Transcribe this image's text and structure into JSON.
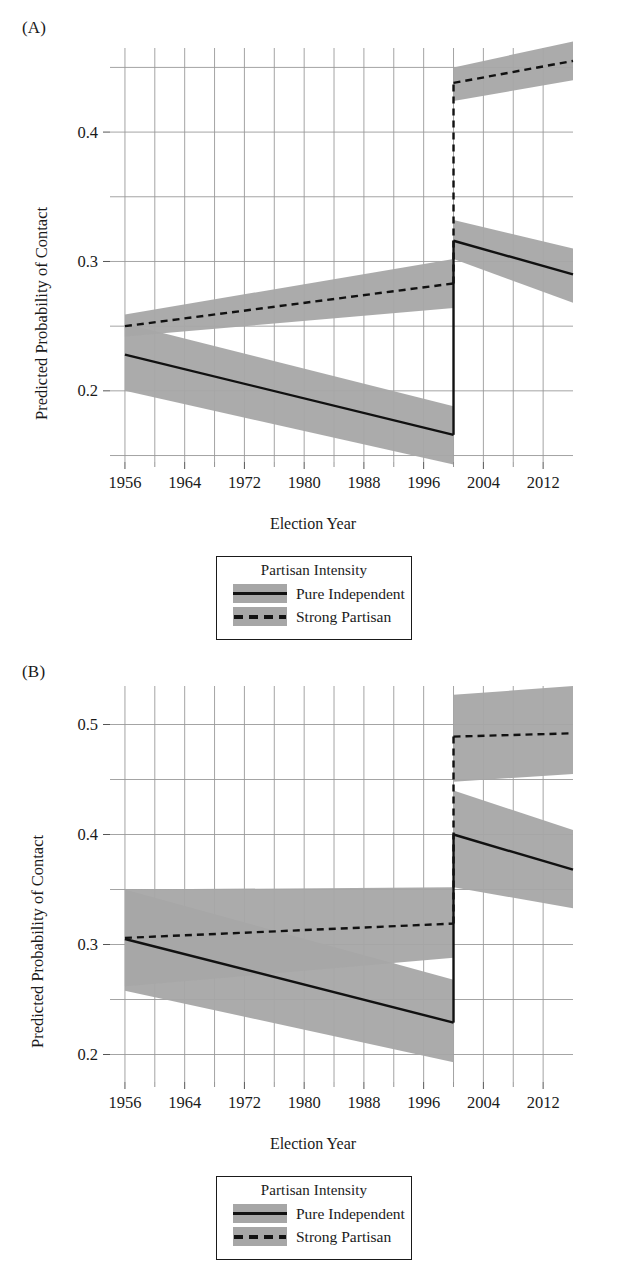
{
  "figure": {
    "panels": [
      {
        "tag": "(A)",
        "xlabel": "Election Year",
        "ylabel": "Predicted Probability of Contact",
        "xticks": [
          "1956",
          "1964",
          "1972",
          "1980",
          "1988",
          "1996",
          "2004",
          "2012"
        ],
        "yticks": [
          "0.2",
          "0.3",
          "0.4"
        ]
      },
      {
        "tag": "(B)",
        "xlabel": "Election Year",
        "ylabel": "Predicted Probability of Contact",
        "xticks": [
          "1956",
          "1964",
          "1972",
          "1980",
          "1988",
          "1996",
          "2004",
          "2012"
        ],
        "yticks": [
          "0.2",
          "0.3",
          "0.4",
          "0.5"
        ]
      }
    ],
    "legend": {
      "title": "Partisan Intensity",
      "entries": [
        {
          "label": "Pure Independent",
          "style": "solid",
          "line_color": "#111111",
          "band_color": "#a6a6a6"
        },
        {
          "label": "Strong Partisan",
          "style": "dashed",
          "line_color": "#111111",
          "band_color": "#a6a6a6"
        }
      ]
    }
  },
  "chart_data": [
    {
      "type": "line",
      "panel": "(A)",
      "title": "",
      "xlabel": "Election Year",
      "ylabel": "Predicted Probability of Contact",
      "xlim": [
        1954,
        2016
      ],
      "ylim": [
        0.145,
        0.465
      ],
      "xticks": [
        1956,
        1964,
        1972,
        1980,
        1988,
        1996,
        2004,
        2012
      ],
      "yticks": [
        0.2,
        0.3,
        0.4
      ],
      "y_minor_gridlines": [
        0.15,
        0.25,
        0.35,
        0.45
      ],
      "x_minor_gridlines": [
        1960,
        1968,
        1976,
        1984,
        1992,
        2000,
        2008
      ],
      "grid": true,
      "legend_position": "below",
      "discontinuity_x": 2000,
      "series": [
        {
          "name": "Pure Independent",
          "style": "solid",
          "color": "#111111",
          "band_color": "#a6a6a6",
          "segments": [
            {
              "x": [
                1956,
                2000
              ],
              "y": [
                0.228,
                0.166
              ],
              "band_lower": [
                0.2,
                0.143
              ],
              "band_upper": [
                0.252,
                0.188
              ]
            },
            {
              "x": [
                2000,
                2016
              ],
              "y": [
                0.316,
                0.29
              ],
              "band_lower": [
                0.302,
                0.268
              ],
              "band_upper": [
                0.332,
                0.31
              ]
            }
          ]
        },
        {
          "name": "Strong Partisan",
          "style": "dashed",
          "color": "#111111",
          "band_color": "#a6a6a6",
          "segments": [
            {
              "x": [
                1956,
                2000
              ],
              "y": [
                0.25,
                0.283
              ],
              "band_lower": [
                0.242,
                0.264
              ],
              "band_upper": [
                0.259,
                0.302
              ]
            },
            {
              "x": [
                2000,
                2016
              ],
              "y": [
                0.438,
                0.455
              ],
              "band_lower": [
                0.424,
                0.44
              ],
              "band_upper": [
                0.45,
                0.47
              ]
            }
          ]
        }
      ]
    },
    {
      "type": "line",
      "panel": "(B)",
      "title": "",
      "xlabel": "Election Year",
      "ylabel": "Predicted Probability of Contact",
      "xlim": [
        1954,
        2016
      ],
      "ylim": [
        0.175,
        0.535
      ],
      "xticks": [
        1956,
        1964,
        1972,
        1980,
        1988,
        1996,
        2004,
        2012
      ],
      "yticks": [
        0.2,
        0.3,
        0.4,
        0.5
      ],
      "y_minor_gridlines": [
        0.25,
        0.35,
        0.45
      ],
      "x_minor_gridlines": [
        1960,
        1968,
        1976,
        1984,
        1992,
        2000,
        2008
      ],
      "grid": true,
      "legend_position": "below",
      "discontinuity_x": 2000,
      "series": [
        {
          "name": "Pure Independent",
          "style": "solid",
          "color": "#111111",
          "band_color": "#a6a6a6",
          "segments": [
            {
              "x": [
                1956,
                2000
              ],
              "y": [
                0.305,
                0.229
              ],
              "band_lower": [
                0.258,
                0.193
              ],
              "band_upper": [
                0.35,
                0.268
              ]
            },
            {
              "x": [
                2000,
                2016
              ],
              "y": [
                0.4,
                0.368
              ],
              "band_lower": [
                0.352,
                0.333
              ],
              "band_upper": [
                0.44,
                0.404
              ]
            }
          ]
        },
        {
          "name": "Strong Partisan",
          "style": "dashed",
          "color": "#111111",
          "band_color": "#a6a6a6",
          "segments": [
            {
              "x": [
                1956,
                2000
              ],
              "y": [
                0.306,
                0.319
              ],
              "band_lower": [
                0.262,
                0.288
              ],
              "band_upper": [
                0.35,
                0.352
              ]
            },
            {
              "x": [
                2000,
                2016
              ],
              "y": [
                0.489,
                0.492
              ],
              "band_lower": [
                0.448,
                0.455
              ],
              "band_upper": [
                0.527,
                0.535
              ]
            }
          ]
        }
      ]
    }
  ]
}
